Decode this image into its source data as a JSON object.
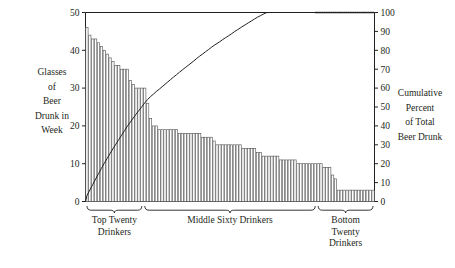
{
  "chart_data": {
    "type": "bar",
    "title": "",
    "subtitle": "",
    "ylabel": "Glasses of Beer Drunk in Week",
    "ylabel_lines": [
      "Glasses",
      "of",
      "Beer",
      "Drunk in",
      "Week"
    ],
    "y2label": "Cumulative Percent of Total Beer Drunk",
    "y2label_lines": [
      "Cumulative",
      "Percent",
      "of Total",
      "Beer Drunk"
    ],
    "xlabel": "",
    "ylim": [
      0,
      50
    ],
    "y2lim": [
      0,
      100
    ],
    "yticks": [
      0,
      10,
      20,
      30,
      40,
      50
    ],
    "ytick_labels": [
      "0",
      "10",
      "20",
      "30",
      "40",
      "50"
    ],
    "y2ticks": [
      0,
      10,
      20,
      30,
      40,
      50,
      60,
      70,
      80,
      90,
      100
    ],
    "y2tick_labels": [
      "0",
      "10",
      "20",
      "30",
      "40",
      "50",
      "60",
      "70",
      "80",
      "90",
      "100"
    ],
    "grid": false,
    "legend": "none",
    "n_bars": 100,
    "values": [
      46,
      44,
      43,
      43,
      42,
      41,
      40,
      39,
      38,
      37,
      36,
      36,
      35,
      35,
      35,
      32,
      31,
      30,
      30,
      30,
      30,
      26,
      22,
      20,
      20,
      19,
      19,
      19,
      19,
      19,
      19,
      19,
      18,
      18,
      18,
      18,
      18,
      18,
      18,
      18,
      17,
      17,
      17,
      17,
      16,
      15,
      15,
      15,
      15,
      15,
      15,
      15,
      15,
      15,
      14,
      14,
      14,
      14,
      14,
      13,
      13,
      12,
      12,
      12,
      12,
      12,
      12,
      11,
      11,
      11,
      11,
      11,
      11,
      10,
      10,
      10,
      10,
      10,
      10,
      10,
      10,
      10,
      9,
      9,
      9,
      7,
      6,
      3,
      3,
      3,
      3,
      3,
      3,
      3,
      3,
      3,
      3,
      3,
      3,
      3
    ],
    "cumulative_percent": [
      3.1,
      6.1,
      9.0,
      11.9,
      14.7,
      17.5,
      20.2,
      22.8,
      25.4,
      27.9,
      30.3,
      32.7,
      35.1,
      37.5,
      39.9,
      42.0,
      44.1,
      46.2,
      48.2,
      50.2,
      52.2,
      54.0,
      55.5,
      56.8,
      58.2,
      59.4,
      60.7,
      62.0,
      63.3,
      64.6,
      65.9,
      67.1,
      68.4,
      69.6,
      70.8,
      72.0,
      73.2,
      74.4,
      75.7,
      76.9,
      78.0,
      79.2,
      80.3,
      81.5,
      82.6,
      83.6,
      84.6,
      85.7,
      86.7,
      87.7,
      88.7,
      89.8,
      90.8,
      91.8,
      92.8,
      93.7,
      94.7,
      95.6,
      96.6,
      97.5,
      98.3,
      99.1,
      99.9,
      100.0,
      100.0,
      100.0,
      100.0,
      100.0,
      100.0,
      100.0,
      100.0,
      100.0,
      100.0,
      100.0,
      100.0,
      100.0,
      100.0,
      100.0,
      100.0,
      100.0,
      100.0,
      100.0,
      100.0,
      100.0,
      100.0,
      100.0,
      100.0,
      100.0,
      100.0,
      100.0,
      100.0,
      100.0,
      100.0,
      100.0,
      100.0,
      100.0,
      100.0,
      100.0,
      100.0,
      100.0
    ],
    "cumulative_line_style": {
      "solid_until_index": 79,
      "dotted_from_index": 79,
      "note": "line is solid across top-twenty and middle-sixty, dotted across bottom-twenty"
    },
    "groups": [
      {
        "label_lines": [
          "Top Twenty",
          "Drinkers"
        ],
        "label": "Top Twenty Drinkers",
        "start_index": 0,
        "end_index": 19,
        "count": 20
      },
      {
        "label_lines": [
          "Middle Sixty Drinkers"
        ],
        "label": "Middle Sixty Drinkers",
        "start_index": 20,
        "end_index": 79,
        "count": 60
      },
      {
        "label_lines": [
          "Bottom",
          "Twenty",
          "Drinkers"
        ],
        "label": "Bottom Twenty Drinkers",
        "start_index": 80,
        "end_index": 99,
        "count": 20
      }
    ],
    "colors": {
      "bar_fill": "#ffffff",
      "bar_stroke": "#5a5a5a",
      "line": "#231f20",
      "axis": "#231f20",
      "background": "#ffffff"
    }
  }
}
